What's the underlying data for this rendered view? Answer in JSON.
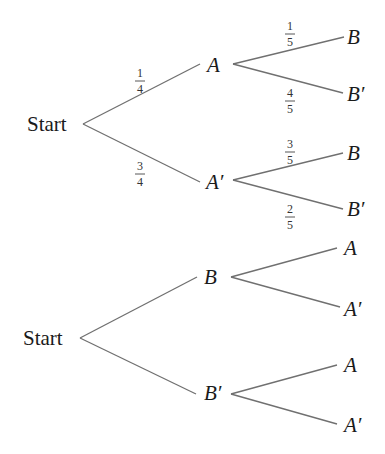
{
  "diagram": {
    "type": "probability-tree-diagrams",
    "tree1": {
      "root": "Start",
      "level1": [
        {
          "label": "A",
          "prob_num": "1",
          "prob_den": "4",
          "children": [
            {
              "label": "B",
              "prob_num": "1",
              "prob_den": "5"
            },
            {
              "label": "B′",
              "prob_num": "4",
              "prob_den": "5"
            }
          ]
        },
        {
          "label": "A′",
          "prob_num": "3",
          "prob_den": "4",
          "children": [
            {
              "label": "B",
              "prob_num": "3",
              "prob_den": "5"
            },
            {
              "label": "B′",
              "prob_num": "2",
              "prob_den": "5"
            }
          ]
        }
      ]
    },
    "tree2": {
      "root": "Start",
      "level1": [
        {
          "label": "B",
          "children": [
            {
              "label": "A"
            },
            {
              "label": "A′"
            }
          ]
        },
        {
          "label": "B′",
          "children": [
            {
              "label": "A"
            },
            {
              "label": "A′"
            }
          ]
        }
      ]
    }
  },
  "colors": {
    "edge": "#707070",
    "text": "#1a1a1a"
  }
}
